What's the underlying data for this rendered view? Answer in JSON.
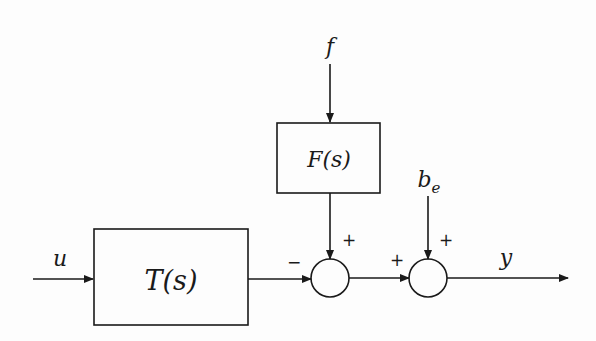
{
  "diagram": {
    "type": "control-block-diagram",
    "signals": {
      "input": "u",
      "disturbance": "f",
      "bias": "b",
      "bias_subscript": "e",
      "output": "y"
    },
    "blocks": [
      {
        "id": "T",
        "label": "T(s)"
      },
      {
        "id": "F",
        "label": "F(s)"
      }
    ],
    "summing_junctions": [
      {
        "id": "sum1",
        "inputs": [
          {
            "from": "T(s)",
            "sign": "−"
          },
          {
            "from": "F(s)",
            "sign": "+"
          }
        ]
      },
      {
        "id": "sum2",
        "inputs": [
          {
            "from": "sum1",
            "sign": "+"
          },
          {
            "from": "b_e",
            "sign": "+"
          }
        ]
      }
    ],
    "signs": {
      "sum1_left": "−",
      "sum1_top": "+",
      "sum2_left": "+",
      "sum2_top": "+"
    },
    "colors": {
      "stroke": "#1a1a1a",
      "background": "#fdfdfd"
    }
  }
}
